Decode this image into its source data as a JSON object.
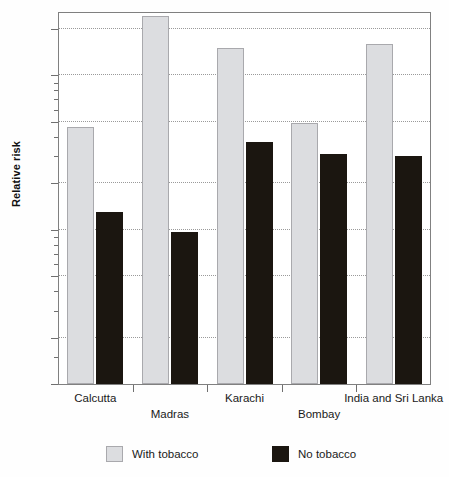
{
  "chart_data": {
    "type": "bar",
    "title": "",
    "xlabel": "",
    "ylabel": "Relative risk",
    "yscale": "log",
    "ylim": [
      0.1,
      26
    ],
    "grid": true,
    "legend_position": "bottom",
    "categories": [
      "Calcutta",
      "Madras",
      "Karachi",
      "Bombay",
      "India and Sri Lanka"
    ],
    "ytick_labels": [
      "0.1",
      "0.2",
      "0.5",
      "1",
      "2",
      "5",
      "10",
      "20"
    ],
    "ytick_values": [
      0.1,
      0.2,
      0.5,
      1,
      2,
      5,
      10,
      20
    ],
    "series": [
      {
        "name": "With tobacco",
        "color": "#dcdde0",
        "values": [
          4.6,
          24.0,
          15.0,
          4.9,
          16.0
        ]
      },
      {
        "name": "No tobacco",
        "color": "#1b1610",
        "values": [
          1.3,
          0.97,
          3.7,
          3.1,
          3.0
        ]
      }
    ]
  },
  "axis": {
    "y_title": "Relative risk"
  },
  "legend": {
    "items": [
      {
        "label": "With tobacco",
        "swatch": "light-gray-square"
      },
      {
        "label": "No tobacco",
        "swatch": "black-square"
      }
    ]
  }
}
